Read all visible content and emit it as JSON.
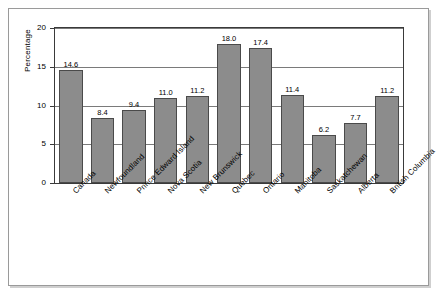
{
  "figure": {
    "background_color": "#ffffff",
    "frame_border_color": "#9a9a9a",
    "bar_fill_color": "#8c8c8c",
    "bar_edge_color": "#4a4a4a",
    "gridline_color": "#7a7a7a",
    "axis_color": "#3a3a3a"
  },
  "chart_data": {
    "type": "bar",
    "title": "",
    "xlabel": "",
    "ylabel": "Percentage",
    "ylim": [
      0,
      20
    ],
    "yticks": [
      "0",
      "5",
      "10",
      "15",
      "20"
    ],
    "grid": true,
    "legend": false,
    "categories": [
      "Canada",
      "Newfoundland",
      "Prince Edward Island",
      "Nova Scotia",
      "New Brunswick",
      "Quebec",
      "Ontario",
      "Manitoba",
      "Saskatchewan",
      "Alberta",
      "British Columbia"
    ],
    "values": [
      14.6,
      8.4,
      9.4,
      11.0,
      11.2,
      18.0,
      17.4,
      11.4,
      6.2,
      7.7,
      11.2
    ],
    "data_labels": [
      "14.6",
      "8.4",
      "9.4",
      "11.0",
      "11.2",
      "18.0",
      "17.4",
      "11.4",
      "6.2",
      "7.7",
      "11.2"
    ]
  }
}
